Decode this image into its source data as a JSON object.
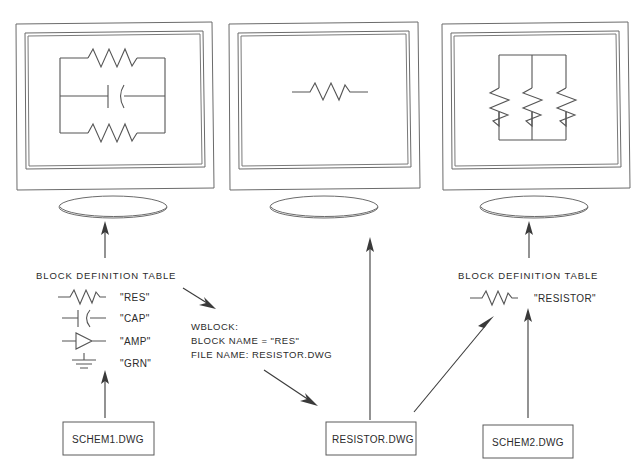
{
  "diagram": {
    "monitors": [
      {
        "id": "monitor-left",
        "screen_content": "parallel circuit: resistor, capacitor, resistor"
      },
      {
        "id": "monitor-center",
        "screen_content": "single resistor symbol"
      },
      {
        "id": "monitor-right",
        "screen_content": "three parallel resistors"
      }
    ],
    "left_table": {
      "heading": "BLOCK DEFINITION TABLE",
      "rows": [
        {
          "symbol": "resistor-symbol",
          "name": "\"RES\""
        },
        {
          "symbol": "capacitor-symbol",
          "name": "\"CAP\""
        },
        {
          "symbol": "amplifier-symbol",
          "name": "\"AMP\""
        },
        {
          "symbol": "ground-symbol",
          "name": "\"GRN\""
        }
      ]
    },
    "right_table": {
      "heading": "BLOCK DEFINITION TABLE",
      "rows": [
        {
          "symbol": "resistor-symbol",
          "name": "\"RESISTOR\""
        }
      ]
    },
    "command_block": {
      "line1": "WBLOCK:",
      "line2": "BLOCK NAME =  \"RES\"",
      "line3": "FILE NAME:   RESISTOR.DWG"
    },
    "file_boxes": [
      {
        "id": "file-schem1",
        "label": "SCHEM1.DWG"
      },
      {
        "id": "file-resistor",
        "label": "RESISTOR.DWG"
      },
      {
        "id": "file-schem2",
        "label": "SCHEM2.DWG"
      }
    ],
    "colors": {
      "line": "#6b6b6b",
      "arrow": "#3a3a3a",
      "text": "#2b2b2b",
      "background": "#ffffff"
    }
  }
}
